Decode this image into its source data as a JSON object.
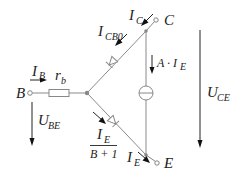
{
  "diagram": {
    "terminals": {
      "base": "B",
      "collector": "C",
      "emitter": "E"
    },
    "labels": {
      "ib_main": "I",
      "ib_sub": "B",
      "rb_main": "r",
      "rb_sub": "b",
      "ic_main": "I",
      "ic_sub": "C",
      "icb0_main": "I",
      "icb0_sub": "CB0",
      "source_main": "A · I",
      "source_sub": "E",
      "uce_main": "U",
      "uce_sub": "CE",
      "ube_main": "U",
      "ube_sub": "BE",
      "frac_num_main": "I",
      "frac_num_sub": "E",
      "frac_den": "B + 1",
      "ie_main": "I",
      "ie_sub": "E"
    },
    "colors": {
      "wire": "#8a8a8a",
      "arrow": "#111111",
      "text": "#222222"
    }
  }
}
